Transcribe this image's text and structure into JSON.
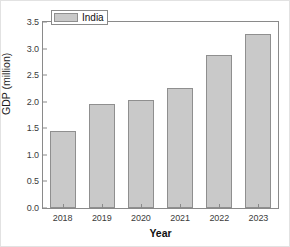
{
  "chart_data": {
    "type": "bar",
    "title": "",
    "categories": [
      "2018",
      "2019",
      "2020",
      "2021",
      "2022",
      "2023"
    ],
    "values": [
      1.44,
      1.95,
      2.04,
      2.26,
      2.87,
      3.27
    ],
    "series": [
      {
        "name": "India",
        "values": [
          1.44,
          1.95,
          2.04,
          2.26,
          2.87,
          3.27
        ]
      }
    ],
    "xlabel": "Year",
    "ylabel": "GDP (million)",
    "ylim": [
      0.0,
      3.5
    ],
    "yticks": [
      "0.0",
      "0.5",
      "1.0",
      "1.5",
      "2.0",
      "2.5",
      "3.0",
      "3.5"
    ],
    "ytick_values": [
      0.0,
      0.5,
      1.0,
      1.5,
      2.0,
      2.5,
      3.0,
      3.5
    ],
    "grid": false,
    "legend": {
      "entries": [
        "India"
      ],
      "position": "top-left"
    },
    "bar_color": "#c9c9c9",
    "bar_edge_color": "#8f8f8f",
    "axis_color": "#8a8a8a",
    "background_color": "#ffffff"
  }
}
